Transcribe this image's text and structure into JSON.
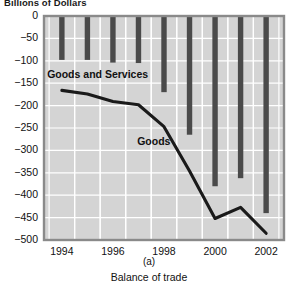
{
  "figure": {
    "axis_title_top": "Billions of Dollars",
    "panel_letter": "(a)",
    "caption": "Balance of trade"
  },
  "labels": {
    "goods_and_services": "Goods and Services",
    "goods": "Goods"
  },
  "colors": {
    "plot_background": "#d4d4d4",
    "gridlines": "#ffffff",
    "bars": "#4a4a4a",
    "line": "#1a1a1a",
    "axis_frame": "#8a8a8a",
    "text": "#111111"
  },
  "chart_data": {
    "type": "bar",
    "title": "Billions of Dollars",
    "subtitle": "Balance of trade",
    "xlabel": "",
    "ylabel": "Billions of Dollars",
    "x": [
      1994,
      1995,
      1996,
      1997,
      1998,
      1999,
      2000,
      2001,
      2002
    ],
    "categories": [
      "1994",
      "1995",
      "1996",
      "1997",
      "1998",
      "1999",
      "2000",
      "2001",
      "2002"
    ],
    "xtick_labels": [
      "1994",
      "1996",
      "1998",
      "2000",
      "2002"
    ],
    "xticks": [
      1994,
      1996,
      1998,
      2000,
      2002
    ],
    "ytick_labels": [
      "0",
      "−50",
      "−100",
      "−150",
      "−200",
      "−250",
      "−300",
      "−350",
      "−400",
      "−450",
      "−500"
    ],
    "yticks": [
      0,
      -50,
      -100,
      -150,
      -200,
      -250,
      -300,
      -350,
      -400,
      -450,
      -500
    ],
    "ylim": [
      -500,
      0
    ],
    "xlim": [
      1993.3,
      2002.7
    ],
    "grid": true,
    "legend": "inline-annotations",
    "series": [
      {
        "name": "Goods and Services",
        "type": "bar",
        "values": [
          -98,
          -98,
          -104,
          -105,
          -170,
          -265,
          -380,
          -362,
          -440
        ]
      },
      {
        "name": "Goods",
        "type": "line",
        "values": [
          -166,
          -174,
          -191,
          -198,
          -247,
          -346,
          -452,
          -427,
          -485
        ]
      }
    ],
    "annotations": [
      {
        "text": "Goods and Services",
        "x": 1995.4,
        "y": -132
      },
      {
        "text": "Goods",
        "x": 1997.6,
        "y": -282
      }
    ]
  }
}
